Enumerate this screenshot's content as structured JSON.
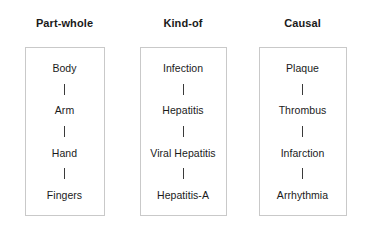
{
  "figure": {
    "columns": [
      {
        "title": "Part-whole",
        "nodes": [
          "Body",
          "Arm",
          "Hand",
          "Fingers"
        ],
        "connector_glyph": "|"
      },
      {
        "title": "Kind-of",
        "nodes": [
          "Infection",
          "Hepatitis",
          "Viral Hepatitis",
          "Hepatitis-A"
        ],
        "connector_glyph": "|"
      },
      {
        "title": "Causal",
        "nodes": [
          "Plaque",
          "Thrombus",
          "Infarction",
          "Arrhythmia"
        ],
        "connector_glyph": "|"
      }
    ],
    "colors": {
      "background": "#ffffff",
      "box_border": "#c9c9c9",
      "text": "#1a1a1a",
      "connector": "#3a3a3a"
    }
  }
}
